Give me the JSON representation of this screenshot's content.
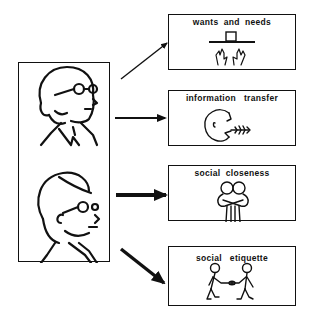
{
  "diagram": {
    "source": {
      "label": "communicating-people",
      "figures": [
        "man-with-glasses",
        "woman-with-glasses"
      ]
    },
    "functions": [
      {
        "title": "wants  and  needs",
        "icon": "hands-reaching-for-object-icon",
        "arrow_weight": "thin"
      },
      {
        "title": "information   transfer",
        "icon": "speaking-head-icon",
        "arrow_weight": "medium"
      },
      {
        "title": "social  closeness",
        "icon": "hugging-people-icon",
        "arrow_weight": "heavy"
      },
      {
        "title": "social   etiquette",
        "icon": "handshake-people-icon",
        "arrow_weight": "heavy"
      }
    ],
    "colors": {
      "ink": "#111111",
      "background": "#ffffff"
    }
  }
}
